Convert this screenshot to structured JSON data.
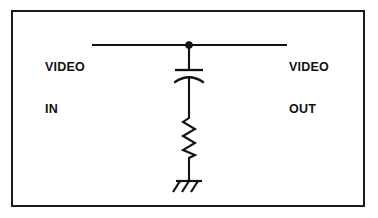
{
  "figure": {
    "width": 378,
    "height": 218,
    "background_color": "#ffffff",
    "line_color": "#111111",
    "frame": {
      "name": "outer-border",
      "color": "#1a1a1a",
      "thickness_px": 2
    }
  },
  "labels": {
    "input": {
      "line1": "VIDEO",
      "line2": "IN"
    },
    "output": {
      "line1": "VIDEO",
      "line2": "OUT"
    }
  },
  "components": [
    {
      "id": "signal-wire",
      "type": "wire",
      "label": "horizontal signal trace from VIDEO IN to VIDEO OUT"
    },
    {
      "id": "junction-dot",
      "type": "junction",
      "label": "connection node"
    },
    {
      "id": "capacitor",
      "type": "capacitor",
      "style": "curved-plate",
      "label": "shunt capacitor"
    },
    {
      "id": "resistor",
      "type": "resistor",
      "style": "zigzag",
      "label": "series resistor to ground"
    },
    {
      "id": "ground",
      "type": "ground",
      "style": "chassis-rake",
      "label": "chassis ground"
    }
  ],
  "geometry": {
    "wire_y": 45,
    "wire_x_start": 92,
    "wire_x_end": 287,
    "branch_x": 189,
    "junction_r": 3.6,
    "cap_top_plate_y": 70,
    "cap_arc_y": 78,
    "cap_half_width": 13,
    "resistor_top": 118,
    "resistor_bottom": 158,
    "resistor_amplitude": 7,
    "ground_bar_y": 181,
    "ground_bar_half_width": 13
  }
}
